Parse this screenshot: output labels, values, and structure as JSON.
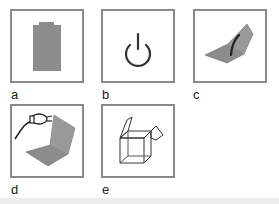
{
  "figure": {
    "panels": [
      {
        "label": "a",
        "icon": "battery-icon",
        "description": "gray battery"
      },
      {
        "label": "b",
        "icon": "power-icon",
        "description": "power symbol"
      },
      {
        "label": "c",
        "icon": "open-laptop-with-curve-icon",
        "description": "folded laptop with dark curve"
      },
      {
        "label": "d",
        "icon": "laptop-with-power-plug-icon",
        "description": "laptop with plug/cable"
      },
      {
        "label": "e",
        "icon": "open-box-icon",
        "description": "wireframe opened box"
      }
    ],
    "colors": {
      "border": "#8a8a8a",
      "fill": "#8c8c8c",
      "line": "#333333",
      "strip": "#ececec"
    }
  }
}
